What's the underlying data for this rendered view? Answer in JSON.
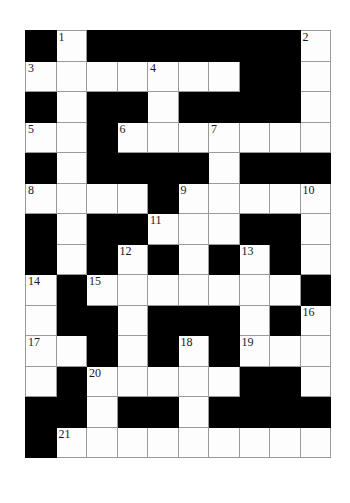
{
  "puzzle": {
    "type": "crossword-grid",
    "rows": 14,
    "columns": 10,
    "cell_size_px": 30.5,
    "colors": {
      "block": "#000000",
      "cell": "#fdfdfd",
      "grid_line": "#9a9a9a",
      "number_text": "#1a1a1a",
      "page_background": "#ffffff"
    },
    "clue_numbers_visible": [
      "1",
      "2",
      "3",
      "4",
      "5",
      "6",
      "7",
      "8",
      "9",
      "10",
      "11",
      "12",
      "13",
      "14",
      "15",
      "16",
      "17",
      "18",
      "19",
      "20",
      "21"
    ],
    "grid": [
      [
        {
          "type": "block",
          "number": ""
        },
        {
          "type": "cell",
          "number": "1"
        },
        {
          "type": "block",
          "number": ""
        },
        {
          "type": "block",
          "number": ""
        },
        {
          "type": "block",
          "number": ""
        },
        {
          "type": "block",
          "number": ""
        },
        {
          "type": "block",
          "number": ""
        },
        {
          "type": "block",
          "number": ""
        },
        {
          "type": "block",
          "number": ""
        },
        {
          "type": "cell",
          "number": "2"
        }
      ],
      [
        {
          "type": "cell",
          "number": "3"
        },
        {
          "type": "cell",
          "number": ""
        },
        {
          "type": "cell",
          "number": ""
        },
        {
          "type": "cell",
          "number": ""
        },
        {
          "type": "cell",
          "number": "4"
        },
        {
          "type": "cell",
          "number": ""
        },
        {
          "type": "cell",
          "number": ""
        },
        {
          "type": "block",
          "number": ""
        },
        {
          "type": "block",
          "number": ""
        },
        {
          "type": "cell",
          "number": ""
        }
      ],
      [
        {
          "type": "block",
          "number": ""
        },
        {
          "type": "cell",
          "number": ""
        },
        {
          "type": "block",
          "number": ""
        },
        {
          "type": "block",
          "number": ""
        },
        {
          "type": "cell",
          "number": ""
        },
        {
          "type": "block",
          "number": ""
        },
        {
          "type": "block",
          "number": ""
        },
        {
          "type": "block",
          "number": ""
        },
        {
          "type": "block",
          "number": ""
        },
        {
          "type": "cell",
          "number": ""
        }
      ],
      [
        {
          "type": "cell",
          "number": "5"
        },
        {
          "type": "cell",
          "number": ""
        },
        {
          "type": "block",
          "number": ""
        },
        {
          "type": "cell",
          "number": "6"
        },
        {
          "type": "cell",
          "number": ""
        },
        {
          "type": "cell",
          "number": ""
        },
        {
          "type": "cell",
          "number": "7"
        },
        {
          "type": "cell",
          "number": ""
        },
        {
          "type": "cell",
          "number": ""
        },
        {
          "type": "cell",
          "number": ""
        }
      ],
      [
        {
          "type": "block",
          "number": ""
        },
        {
          "type": "cell",
          "number": ""
        },
        {
          "type": "block",
          "number": ""
        },
        {
          "type": "block",
          "number": ""
        },
        {
          "type": "block",
          "number": ""
        },
        {
          "type": "block",
          "number": ""
        },
        {
          "type": "cell",
          "number": ""
        },
        {
          "type": "block",
          "number": ""
        },
        {
          "type": "block",
          "number": ""
        },
        {
          "type": "block",
          "number": ""
        }
      ],
      [
        {
          "type": "cell",
          "number": "8"
        },
        {
          "type": "cell",
          "number": ""
        },
        {
          "type": "cell",
          "number": ""
        },
        {
          "type": "cell",
          "number": ""
        },
        {
          "type": "block",
          "number": ""
        },
        {
          "type": "cell",
          "number": "9"
        },
        {
          "type": "cell",
          "number": ""
        },
        {
          "type": "cell",
          "number": ""
        },
        {
          "type": "cell",
          "number": ""
        },
        {
          "type": "cell",
          "number": "10"
        }
      ],
      [
        {
          "type": "block",
          "number": ""
        },
        {
          "type": "cell",
          "number": ""
        },
        {
          "type": "block",
          "number": ""
        },
        {
          "type": "block",
          "number": ""
        },
        {
          "type": "cell",
          "number": "11"
        },
        {
          "type": "cell",
          "number": ""
        },
        {
          "type": "cell",
          "number": ""
        },
        {
          "type": "block",
          "number": ""
        },
        {
          "type": "block",
          "number": ""
        },
        {
          "type": "cell",
          "number": ""
        }
      ],
      [
        {
          "type": "block",
          "number": ""
        },
        {
          "type": "cell",
          "number": ""
        },
        {
          "type": "block",
          "number": ""
        },
        {
          "type": "cell",
          "number": "12"
        },
        {
          "type": "block",
          "number": ""
        },
        {
          "type": "cell",
          "number": ""
        },
        {
          "type": "block",
          "number": ""
        },
        {
          "type": "cell",
          "number": "13"
        },
        {
          "type": "block",
          "number": ""
        },
        {
          "type": "cell",
          "number": ""
        }
      ],
      [
        {
          "type": "cell",
          "number": "14"
        },
        {
          "type": "block",
          "number": ""
        },
        {
          "type": "cell",
          "number": "15"
        },
        {
          "type": "cell",
          "number": ""
        },
        {
          "type": "cell",
          "number": ""
        },
        {
          "type": "cell",
          "number": ""
        },
        {
          "type": "cell",
          "number": ""
        },
        {
          "type": "cell",
          "number": ""
        },
        {
          "type": "cell",
          "number": ""
        },
        {
          "type": "block",
          "number": ""
        }
      ],
      [
        {
          "type": "cell",
          "number": ""
        },
        {
          "type": "block",
          "number": ""
        },
        {
          "type": "block",
          "number": ""
        },
        {
          "type": "cell",
          "number": ""
        },
        {
          "type": "block",
          "number": ""
        },
        {
          "type": "block",
          "number": ""
        },
        {
          "type": "block",
          "number": ""
        },
        {
          "type": "cell",
          "number": ""
        },
        {
          "type": "block",
          "number": ""
        },
        {
          "type": "cell",
          "number": "16"
        }
      ],
      [
        {
          "type": "cell",
          "number": "17"
        },
        {
          "type": "cell",
          "number": ""
        },
        {
          "type": "block",
          "number": ""
        },
        {
          "type": "cell",
          "number": ""
        },
        {
          "type": "block",
          "number": ""
        },
        {
          "type": "cell",
          "number": "18"
        },
        {
          "type": "block",
          "number": ""
        },
        {
          "type": "cell",
          "number": "19"
        },
        {
          "type": "cell",
          "number": ""
        },
        {
          "type": "cell",
          "number": ""
        }
      ],
      [
        {
          "type": "cell",
          "number": ""
        },
        {
          "type": "block",
          "number": ""
        },
        {
          "type": "cell",
          "number": "20"
        },
        {
          "type": "cell",
          "number": ""
        },
        {
          "type": "cell",
          "number": ""
        },
        {
          "type": "cell",
          "number": ""
        },
        {
          "type": "cell",
          "number": ""
        },
        {
          "type": "block",
          "number": ""
        },
        {
          "type": "block",
          "number": ""
        },
        {
          "type": "cell",
          "number": ""
        }
      ],
      [
        {
          "type": "block",
          "number": ""
        },
        {
          "type": "block",
          "number": ""
        },
        {
          "type": "cell",
          "number": ""
        },
        {
          "type": "block",
          "number": ""
        },
        {
          "type": "block",
          "number": ""
        },
        {
          "type": "cell",
          "number": ""
        },
        {
          "type": "block",
          "number": ""
        },
        {
          "type": "block",
          "number": ""
        },
        {
          "type": "block",
          "number": ""
        },
        {
          "type": "block",
          "number": ""
        }
      ],
      [
        {
          "type": "block",
          "number": ""
        },
        {
          "type": "cell",
          "number": "21"
        },
        {
          "type": "cell",
          "number": ""
        },
        {
          "type": "cell",
          "number": ""
        },
        {
          "type": "cell",
          "number": ""
        },
        {
          "type": "cell",
          "number": ""
        },
        {
          "type": "cell",
          "number": ""
        },
        {
          "type": "cell",
          "number": ""
        },
        {
          "type": "cell",
          "number": ""
        },
        {
          "type": "cell",
          "number": ""
        }
      ]
    ]
  }
}
